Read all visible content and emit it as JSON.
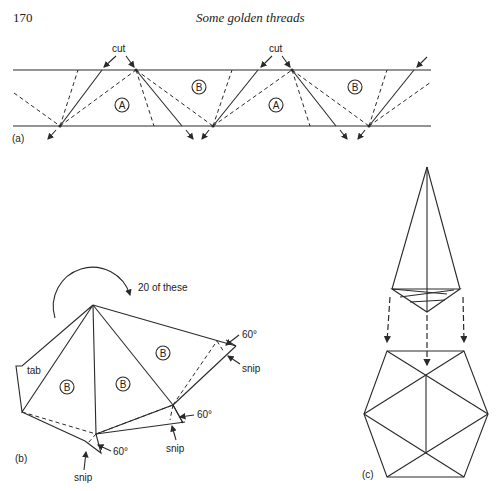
{
  "header": {
    "page_number": "170",
    "running_title": "Some golden threads"
  },
  "figure_a": {
    "panel_label": "(a)",
    "cut_labels": [
      "cut",
      "cut"
    ],
    "region_labels": [
      "A",
      "B",
      "A",
      "B"
    ]
  },
  "figure_b": {
    "panel_label": "(b)",
    "count_label": "20 of these",
    "tab_label": "tab",
    "region_labels": [
      "B",
      "B",
      "B"
    ],
    "angle_labels": [
      "60°",
      "60°",
      "60°"
    ],
    "snip_labels": [
      "snip",
      "snip",
      "snip"
    ]
  },
  "figure_c": {
    "panel_label": "(c)"
  },
  "colors": {
    "ink": "#2a2a2a",
    "background": "#ffffff"
  }
}
